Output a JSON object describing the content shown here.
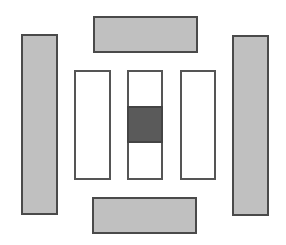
{
  "diagram": {
    "colors": {
      "background": "#ffffff",
      "outer_fill": "#c0c0c0",
      "inner_fill": "#ffffff",
      "highlight_fill": "#5a5a5a",
      "stroke": "#4a4a4a"
    },
    "shapes": [
      {
        "id": "outer-left",
        "kind": "outer-bar",
        "x": 21,
        "y": 34,
        "w": 37,
        "h": 181
      },
      {
        "id": "outer-right",
        "kind": "outer-bar",
        "x": 232,
        "y": 35,
        "w": 37,
        "h": 181
      },
      {
        "id": "outer-top",
        "kind": "outer-bar",
        "x": 93,
        "y": 16,
        "w": 105,
        "h": 37
      },
      {
        "id": "outer-bottom",
        "kind": "outer-bar",
        "x": 92,
        "y": 197,
        "w": 105,
        "h": 37
      },
      {
        "id": "inner-left",
        "kind": "inner-column",
        "x": 74,
        "y": 70,
        "w": 37,
        "h": 110
      },
      {
        "id": "inner-center",
        "kind": "inner-column",
        "x": 127,
        "y": 70,
        "w": 36,
        "h": 110
      },
      {
        "id": "inner-right",
        "kind": "inner-column",
        "x": 180,
        "y": 70,
        "w": 36,
        "h": 110
      },
      {
        "id": "center-block",
        "kind": "highlight-block",
        "x": 127,
        "y": 106,
        "w": 36,
        "h": 37
      }
    ]
  }
}
